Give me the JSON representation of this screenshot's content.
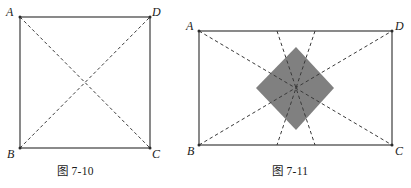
{
  "page": {
    "background_color": "#ffffff",
    "stroke_color": "#2b2b2b",
    "dash_color": "#3a3a3a",
    "shade_color": "#808080",
    "width": 411,
    "height": 188
  },
  "figures": [
    {
      "id": "figure-7-10",
      "caption": "图 7-10",
      "shape": "square",
      "rect": {
        "x": 20,
        "y": 17,
        "width": 130,
        "height": 131
      },
      "vertices": [
        {
          "name": "A",
          "label": "A",
          "position": "top-left"
        },
        {
          "name": "D",
          "label": "D",
          "position": "top-right"
        },
        {
          "name": "B",
          "label": "B",
          "position": "bottom-left"
        },
        {
          "name": "C",
          "label": "C",
          "position": "bottom-right"
        }
      ],
      "dashed_lines": [
        {
          "name": "diagonal-A-C",
          "from": "A",
          "to": "C"
        },
        {
          "name": "diagonal-B-D",
          "from": "B",
          "to": "D"
        }
      ],
      "shaded_regions": []
    },
    {
      "id": "figure-7-11",
      "caption": "图 7-11",
      "shape": "rectangle",
      "rect": {
        "x": 199,
        "y": 31,
        "width": 193,
        "height": 114
      },
      "vertices": [
        {
          "name": "A",
          "label": "A",
          "position": "top-left"
        },
        {
          "name": "D",
          "label": "D",
          "position": "top-right"
        },
        {
          "name": "B",
          "label": "B",
          "position": "bottom-left"
        },
        {
          "name": "C",
          "label": "C",
          "position": "bottom-right"
        }
      ],
      "dashed_lines": [
        {
          "name": "diagonal-A-C",
          "from": "A",
          "to": "C"
        },
        {
          "name": "diagonal-B-D",
          "from": "B",
          "to": "D"
        },
        {
          "name": "line-top-mid-left-to-bottom-mid-right",
          "from": "top-edge",
          "to": "bottom-edge"
        },
        {
          "name": "line-top-mid-right-to-bottom-mid-left",
          "from": "top-edge",
          "to": "bottom-edge"
        }
      ],
      "shaded_regions": [
        {
          "name": "shaded-diamond",
          "fill": "#808080",
          "vertices": [
            {
              "x": 296,
              "y": 47
            },
            {
              "x": 334,
              "y": 88
            },
            {
              "x": 296,
              "y": 130
            },
            {
              "x": 256,
              "y": 88
            }
          ]
        }
      ]
    }
  ]
}
